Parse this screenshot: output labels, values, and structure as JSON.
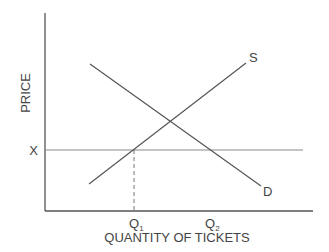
{
  "diagram": {
    "type": "supply-demand",
    "y_axis_label": "PRICE",
    "x_axis_label": "QUANTITY OF TICKETS",
    "price_level_label": "X",
    "curves": [
      {
        "name": "supply",
        "label": "S"
      },
      {
        "name": "demand",
        "label": "D"
      }
    ],
    "quantity_markers": [
      {
        "label": "Q",
        "subscript": "1"
      },
      {
        "label": "Q",
        "subscript": "2"
      }
    ],
    "colors": {
      "axis": "#555555",
      "curve": "#555555",
      "price_line": "#888888",
      "text": "#444444"
    }
  }
}
